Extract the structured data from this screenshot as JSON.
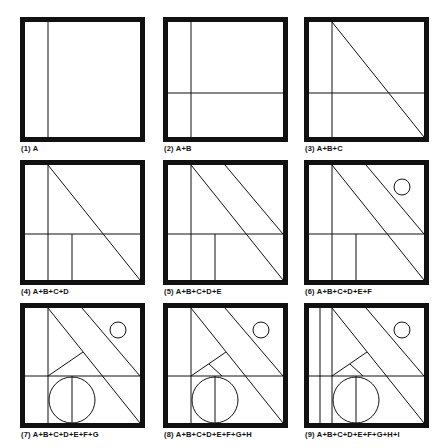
{
  "figure": {
    "stroke_color": "#111111",
    "background": "#ffffff",
    "panels": [
      {
        "label": "(1) A",
        "elements": [
          "A"
        ]
      },
      {
        "label": "(2) A+B",
        "elements": [
          "A",
          "B"
        ]
      },
      {
        "label": "(3) A+B+C",
        "elements": [
          "A",
          "B",
          "C"
        ]
      },
      {
        "label": "(4) A+B+C+D",
        "elements": [
          "A",
          "B",
          "C",
          "D"
        ]
      },
      {
        "label": "(5) A+B+C+D+E",
        "elements": [
          "A",
          "B",
          "C",
          "D",
          "E"
        ]
      },
      {
        "label": "(6) A+B+C+D+E+F",
        "elements": [
          "A",
          "B",
          "C",
          "D",
          "E",
          "F"
        ]
      },
      {
        "label": "(7) A+B+C+D+E+F+G",
        "elements": [
          "A",
          "B",
          "C",
          "D",
          "E",
          "F",
          "G"
        ]
      },
      {
        "label": "(8) A+B+C+D+E+F+G+H",
        "elements": [
          "A",
          "B",
          "C",
          "D",
          "E",
          "F",
          "G",
          "H"
        ]
      },
      {
        "label": "(9) A+B+C+D+E+F+G+H+I",
        "elements": [
          "A",
          "B",
          "C",
          "D",
          "E",
          "F",
          "G",
          "H",
          "I"
        ]
      }
    ]
  }
}
